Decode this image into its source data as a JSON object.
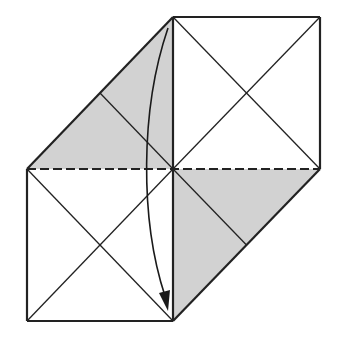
{
  "diagram": {
    "title": "",
    "type": "origami-fold-step",
    "colors": {
      "background": "#ffffff",
      "line": "#222222",
      "shade": "#d2d2d2",
      "arrow": "#1a1a1a"
    },
    "points": {
      "top": [
        173,
        17
      ],
      "top_right": [
        320,
        17
      ],
      "left_mid": [
        27,
        169
      ],
      "center": [
        173,
        169
      ],
      "right_mid": [
        320,
        169
      ],
      "bottom_left": [
        27,
        321
      ],
      "bottom": [
        173,
        321
      ]
    },
    "shaded_regions": [
      {
        "name": "upper-left-flap",
        "points": [
          [
            27,
            169
          ],
          [
            173,
            17
          ],
          [
            173,
            169
          ]
        ]
      },
      {
        "name": "lower-right-flap",
        "points": [
          [
            173,
            169
          ],
          [
            320,
            169
          ],
          [
            173,
            321
          ]
        ]
      }
    ],
    "fold_lines": {
      "valley_fold": {
        "from": [
          27,
          169
        ],
        "to": [
          320,
          169
        ],
        "style": "dashed"
      }
    },
    "arrow": {
      "path": "M168,28 C140,110 140,220 167,300",
      "direction": "down",
      "tip": [
        168,
        311
      ]
    }
  }
}
